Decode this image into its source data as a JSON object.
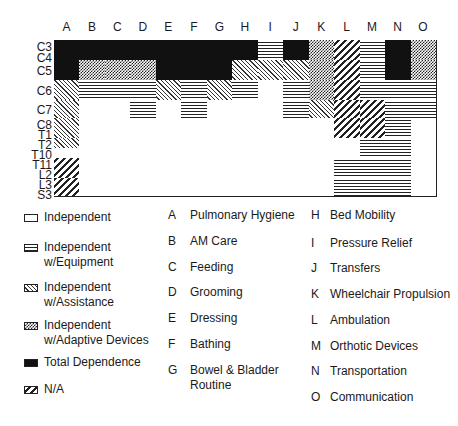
{
  "columns": [
    "A",
    "B",
    "C",
    "D",
    "E",
    "F",
    "G",
    "H",
    "I",
    "J",
    "K",
    "L",
    "M",
    "N",
    "O"
  ],
  "row_labels": [
    {
      "text": "C3",
      "y": 42
    },
    {
      "text": "C4",
      "y": 53
    },
    {
      "text": "C5",
      "y": 66
    },
    {
      "text": "C6",
      "y": 86
    },
    {
      "text": "C7",
      "y": 105
    },
    {
      "text": "C8",
      "y": 120
    },
    {
      "text": "T1",
      "y": 130
    },
    {
      "text": "T2",
      "y": 140
    },
    {
      "text": "T10",
      "y": 150
    },
    {
      "text": "T11",
      "y": 160
    },
    {
      "text": "L2",
      "y": 170
    },
    {
      "text": "L3",
      "y": 180
    },
    {
      "text": "S3",
      "y": 190
    }
  ],
  "row_bounds": [
    0,
    20,
    40,
    60,
    78,
    98,
    118,
    138,
    156
  ],
  "grid_rows": [
    [
      "black",
      "black",
      "black",
      "black",
      "black",
      "black",
      "black",
      "black",
      "horiz",
      "black",
      "checker",
      "na",
      "horiz",
      "black",
      "checker"
    ],
    [
      "black",
      "checker",
      "checker",
      "checker",
      "black",
      "black",
      "black",
      "assist",
      "assist",
      "assist",
      "checker",
      "na",
      "horiz",
      "black",
      "checker"
    ],
    [
      "assist",
      "horiz",
      "horiz",
      "horiz",
      "assist",
      "horiz",
      "assist",
      "horiz",
      "white",
      "horiz",
      "checker",
      "na",
      "horiz",
      "horiz",
      "horiz"
    ],
    [
      "assist",
      "white",
      "white",
      "horiz",
      "white",
      "horiz",
      "white",
      "white",
      "white",
      "horiz",
      "assist",
      "na",
      "na",
      "horiz",
      "horiz"
    ],
    [
      "assist",
      "white",
      "white",
      "white",
      "white",
      "white",
      "white",
      "white",
      "white",
      "white",
      "white",
      "na",
      "na",
      "horiz",
      "white"
    ],
    [
      "half",
      "white",
      "white",
      "white",
      "white",
      "white",
      "white",
      "white",
      "white",
      "white",
      "white",
      "white",
      "horiz",
      "horiz",
      "white"
    ],
    [
      "na",
      "white",
      "white",
      "white",
      "white",
      "white",
      "white",
      "white",
      "white",
      "white",
      "white",
      "horiz",
      "horiz",
      "horiz",
      "white"
    ],
    [
      "na",
      "white",
      "white",
      "white",
      "white",
      "white",
      "white",
      "white",
      "white",
      "white",
      "white",
      "horiz",
      "horiz",
      "horiz",
      "white"
    ]
  ],
  "legend": [
    {
      "pattern": "white",
      "label_line1": "Independent",
      "label_line2": "",
      "y": 210
    },
    {
      "pattern": "horiz",
      "label_line1": "Independent",
      "label_line2": "w/Equipment",
      "y": 240
    },
    {
      "pattern": "assist",
      "label_line1": "Independent",
      "label_line2": "w/Assistance",
      "y": 280
    },
    {
      "pattern": "checker",
      "label_line1": "Independent",
      "label_line2": "w/Adaptive Devices",
      "y": 318
    },
    {
      "pattern": "black",
      "label_line1": "Total Dependence",
      "label_line2": "",
      "y": 355
    },
    {
      "pattern": "na",
      "label_line1": "N/A",
      "label_line2": "",
      "y": 382
    }
  ],
  "key_left": [
    {
      "letter": "A",
      "text": "Pulmonary Hygiene",
      "text2": "",
      "y": 208
    },
    {
      "letter": "B",
      "text": "AM Care",
      "text2": "",
      "y": 234
    },
    {
      "letter": "C",
      "text": "Feeding",
      "text2": "",
      "y": 260
    },
    {
      "letter": "D",
      "text": "Grooming",
      "text2": "",
      "y": 285
    },
    {
      "letter": "E",
      "text": "Dressing",
      "text2": "",
      "y": 311
    },
    {
      "letter": "F",
      "text": "Bathing",
      "text2": "",
      "y": 337
    },
    {
      "letter": "G",
      "text": "Bowel & Bladder",
      "text2": "Routine",
      "y": 363
    }
  ],
  "key_right": [
    {
      "letter": "H",
      "text": "Bed Mobility",
      "y": 208
    },
    {
      "letter": "I",
      "text": "Pressure Relief",
      "y": 236
    },
    {
      "letter": "J",
      "text": "Transfers",
      "y": 261
    },
    {
      "letter": "K",
      "text": "Wheelchair Propulsion",
      "y": 287
    },
    {
      "letter": "L",
      "text": "Ambulation",
      "y": 313
    },
    {
      "letter": "M",
      "text": "Orthotic Devices",
      "y": 339
    },
    {
      "letter": "N",
      "text": "Transportation",
      "y": 364
    },
    {
      "letter": "O",
      "text": "Communication",
      "y": 390
    }
  ]
}
